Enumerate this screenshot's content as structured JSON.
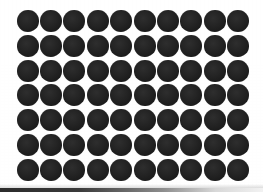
{
  "image": {
    "title": "Dot grid pattern",
    "width": 263,
    "height": 192,
    "background_color": "#fefefe",
    "paper_tint": "#f4f4f3"
  },
  "dot_grid": {
    "name": "circle-dot-grid",
    "columns": 10,
    "rows": 7,
    "total_dots": 70,
    "dot_color": "#1f1f1f",
    "dot_diameter_px": 22,
    "column_pitch_px": 24.8,
    "row_pitch_px": 24.5,
    "grid_left_px": 16,
    "grid_top_px": 9,
    "grid_width_px": 234,
    "grid_height_px": 173,
    "shape": "circle"
  },
  "bottom_edge": {
    "name": "scan-edge-shadow",
    "color": "#2b2b2b",
    "height_px": 4
  }
}
